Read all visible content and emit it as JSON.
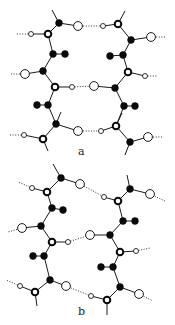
{
  "figure": {
    "panels": [
      {
        "label": "a",
        "label_pos": [
          78,
          155
        ],
        "atoms": [
          {
            "id": "a1",
            "type": "black",
            "x": 59,
            "y": 23
          },
          {
            "id": "a2",
            "type": "open-lg",
            "x": 78,
            "y": 26
          },
          {
            "id": "a3",
            "type": "open-sm",
            "x": 103,
            "y": 26
          },
          {
            "id": "a4",
            "type": "ring",
            "x": 118,
            "y": 24
          },
          {
            "id": "a5",
            "type": "black",
            "x": 131,
            "y": 40
          },
          {
            "id": "a6",
            "type": "open-lg",
            "x": 151,
            "y": 37
          },
          {
            "id": "a7",
            "type": "ring",
            "x": 48,
            "y": 34
          },
          {
            "id": "a8",
            "type": "open-sm",
            "x": 31,
            "y": 34
          },
          {
            "id": "a9",
            "type": "black",
            "x": 53,
            "y": 54
          },
          {
            "id": "a10",
            "type": "black",
            "x": 65,
            "y": 54
          },
          {
            "id": "a11",
            "type": "black",
            "x": 43,
            "y": 71
          },
          {
            "id": "a12",
            "type": "open-lg",
            "x": 25,
            "y": 74
          },
          {
            "id": "a13",
            "type": "ring",
            "x": 55,
            "y": 87
          },
          {
            "id": "a14",
            "type": "open-sm",
            "x": 72,
            "y": 87
          },
          {
            "id": "a15",
            "type": "open-lg",
            "x": 94,
            "y": 86
          },
          {
            "id": "a16",
            "type": "black",
            "x": 115,
            "y": 88
          },
          {
            "id": "a17",
            "type": "black",
            "x": 123,
            "y": 55
          },
          {
            "id": "a18",
            "type": "black",
            "x": 110,
            "y": 56
          },
          {
            "id": "a19",
            "type": "ring",
            "x": 128,
            "y": 72
          },
          {
            "id": "a20",
            "type": "open-sm",
            "x": 145,
            "y": 76
          },
          {
            "id": "a21",
            "type": "black",
            "x": 37,
            "y": 105
          },
          {
            "id": "a22",
            "type": "black",
            "x": 48,
            "y": 105
          },
          {
            "id": "a23",
            "type": "black",
            "x": 124,
            "y": 106
          },
          {
            "id": "a24",
            "type": "black",
            "x": 135,
            "y": 106
          },
          {
            "id": "a25",
            "type": "black",
            "x": 56,
            "y": 124
          },
          {
            "id": "a26",
            "type": "open-lg",
            "x": 78,
            "y": 131
          },
          {
            "id": "a27",
            "type": "open-sm",
            "x": 101,
            "y": 131
          },
          {
            "id": "a28",
            "type": "ring",
            "x": 116,
            "y": 126
          },
          {
            "id": "a29",
            "type": "black",
            "x": 130,
            "y": 142
          },
          {
            "id": "a30",
            "type": "open-lg",
            "x": 148,
            "y": 137
          },
          {
            "id": "a31",
            "type": "ring",
            "x": 43,
            "y": 139
          },
          {
            "id": "a32",
            "type": "open-sm",
            "x": 24,
            "y": 135
          }
        ],
        "bonds": [
          [
            "a1",
            "a2"
          ],
          [
            "a1",
            "a7"
          ],
          [
            "a7",
            "a8"
          ],
          [
            "a7",
            "a9"
          ],
          [
            "a9",
            "a10"
          ],
          [
            "a9",
            "a11"
          ],
          [
            "a11",
            "a12"
          ],
          [
            "a11",
            "a13"
          ],
          [
            "a13",
            "a14"
          ],
          [
            "a13",
            "a22"
          ],
          [
            "a22",
            "a21"
          ],
          [
            "a22",
            "a25"
          ],
          [
            "a25",
            "a26"
          ],
          [
            "a25",
            "a31"
          ],
          [
            "a31",
            "a32"
          ],
          [
            "a3",
            "a4"
          ],
          [
            "a4",
            "a5"
          ],
          [
            "a5",
            "a6"
          ],
          [
            "a5",
            "a17"
          ],
          [
            "a17",
            "a18"
          ],
          [
            "a17",
            "a19"
          ],
          [
            "a19",
            "a20"
          ],
          [
            "a19",
            "a16"
          ],
          [
            "a15",
            "a16"
          ],
          [
            "a16",
            "a23"
          ],
          [
            "a23",
            "a24"
          ],
          [
            "a23",
            "a28"
          ],
          [
            "a27",
            "a28"
          ],
          [
            "a28",
            "a29"
          ],
          [
            "a29",
            "a30"
          ]
        ],
        "stubs": [
          [
            59,
            23,
            52,
            10
          ],
          [
            118,
            24,
            125,
            11
          ],
          [
            56,
            124,
            61,
            112
          ],
          [
            116,
            126,
            122,
            113
          ],
          [
            43,
            139,
            48,
            151
          ],
          [
            130,
            142,
            125,
            155
          ]
        ],
        "hbonds": [
          [
            78,
            26,
            103,
            26
          ],
          [
            72,
            87,
            94,
            86
          ],
          [
            78,
            131,
            101,
            131
          ],
          [
            31,
            34,
            17,
            34
          ],
          [
            25,
            74,
            10,
            74
          ],
          [
            24,
            135,
            9,
            135
          ],
          [
            151,
            37,
            166,
            37
          ],
          [
            145,
            76,
            158,
            76
          ],
          [
            148,
            137,
            163,
            137
          ]
        ]
      },
      {
        "label": "b",
        "label_pos": [
          78,
          315
        ],
        "atoms": [
          {
            "id": "b1",
            "type": "black",
            "x": 61,
            "y": 178
          },
          {
            "id": "b2",
            "type": "open-lg",
            "x": 80,
            "y": 184
          },
          {
            "id": "b3",
            "type": "ring",
            "x": 47,
            "y": 192
          },
          {
            "id": "b4",
            "type": "open-sm",
            "x": 32,
            "y": 188
          },
          {
            "id": "b5",
            "type": "black",
            "x": 52,
            "y": 208
          },
          {
            "id": "b6",
            "type": "black",
            "x": 63,
            "y": 210
          },
          {
            "id": "b7",
            "type": "black",
            "x": 41,
            "y": 226
          },
          {
            "id": "b8",
            "type": "open-lg",
            "x": 22,
            "y": 228
          },
          {
            "id": "b9",
            "type": "ring",
            "x": 52,
            "y": 242
          },
          {
            "id": "b10",
            "type": "open-sm",
            "x": 68,
            "y": 242
          },
          {
            "id": "b11",
            "type": "black",
            "x": 33,
            "y": 256
          },
          {
            "id": "b12",
            "type": "black",
            "x": 44,
            "y": 256
          },
          {
            "id": "b13",
            "type": "black",
            "x": 50,
            "y": 280
          },
          {
            "id": "b14",
            "type": "open-lg",
            "x": 66,
            "y": 286
          },
          {
            "id": "b15",
            "type": "ring",
            "x": 35,
            "y": 292
          },
          {
            "id": "b16",
            "type": "open-sm",
            "x": 20,
            "y": 286
          },
          {
            "id": "b17",
            "type": "open-sm",
            "x": 104,
            "y": 197
          },
          {
            "id": "b18",
            "type": "ring",
            "x": 118,
            "y": 201
          },
          {
            "id": "b19",
            "type": "black",
            "x": 130,
            "y": 189
          },
          {
            "id": "b20",
            "type": "open-lg",
            "x": 150,
            "y": 194
          },
          {
            "id": "b21",
            "type": "black",
            "x": 123,
            "y": 221
          },
          {
            "id": "b22",
            "type": "black",
            "x": 135,
            "y": 221
          },
          {
            "id": "b23",
            "type": "black",
            "x": 110,
            "y": 235
          },
          {
            "id": "b24",
            "type": "open-lg",
            "x": 90,
            "y": 235
          },
          {
            "id": "b25",
            "type": "ring",
            "x": 120,
            "y": 252
          },
          {
            "id": "b26",
            "type": "open-sm",
            "x": 136,
            "y": 251
          },
          {
            "id": "b27",
            "type": "black",
            "x": 101,
            "y": 267
          },
          {
            "id": "b28",
            "type": "black",
            "x": 113,
            "y": 267
          },
          {
            "id": "b29",
            "type": "black",
            "x": 120,
            "y": 287
          },
          {
            "id": "b30",
            "type": "open-lg",
            "x": 139,
            "y": 294
          },
          {
            "id": "b31",
            "type": "ring",
            "x": 107,
            "y": 300
          },
          {
            "id": "b32",
            "type": "open-sm",
            "x": 91,
            "y": 296
          }
        ],
        "bonds": [
          [
            "b1",
            "b2"
          ],
          [
            "b1",
            "b3"
          ],
          [
            "b3",
            "b4"
          ],
          [
            "b3",
            "b5"
          ],
          [
            "b5",
            "b6"
          ],
          [
            "b5",
            "b7"
          ],
          [
            "b7",
            "b8"
          ],
          [
            "b7",
            "b9"
          ],
          [
            "b9",
            "b10"
          ],
          [
            "b9",
            "b12"
          ],
          [
            "b12",
            "b11"
          ],
          [
            "b12",
            "b13"
          ],
          [
            "b13",
            "b14"
          ],
          [
            "b13",
            "b15"
          ],
          [
            "b15",
            "b16"
          ],
          [
            "b17",
            "b18"
          ],
          [
            "b18",
            "b19"
          ],
          [
            "b19",
            "b20"
          ],
          [
            "b18",
            "b21"
          ],
          [
            "b21",
            "b22"
          ],
          [
            "b21",
            "b23"
          ],
          [
            "b23",
            "b24"
          ],
          [
            "b23",
            "b25"
          ],
          [
            "b25",
            "b26"
          ],
          [
            "b25",
            "b28"
          ],
          [
            "b28",
            "b27"
          ],
          [
            "b28",
            "b29"
          ],
          [
            "b29",
            "b30"
          ],
          [
            "b29",
            "b31"
          ],
          [
            "b31",
            "b32"
          ]
        ],
        "stubs": [
          [
            61,
            178,
            53,
            164
          ],
          [
            130,
            189,
            127,
            175
          ],
          [
            35,
            292,
            37,
            306
          ],
          [
            107,
            300,
            107,
            315
          ]
        ],
        "hbonds": [
          [
            84,
            186,
            104,
            197
          ],
          [
            68,
            242,
            90,
            235
          ],
          [
            66,
            286,
            91,
            296
          ],
          [
            32,
            188,
            18,
            182
          ],
          [
            22,
            228,
            8,
            232
          ],
          [
            20,
            286,
            6,
            280
          ],
          [
            150,
            194,
            165,
            201
          ],
          [
            136,
            251,
            150,
            248
          ],
          [
            139,
            294,
            153,
            301
          ]
        ]
      }
    ]
  }
}
